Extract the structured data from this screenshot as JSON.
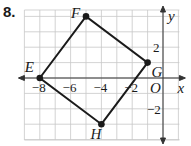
{
  "problem": {
    "number": "8."
  },
  "graph": {
    "x_axis_label": "x",
    "y_axis_label": "y",
    "origin_label": "O",
    "x_ticks": [
      {
        "value": -8,
        "label": "−8"
      },
      {
        "value": -6,
        "label": "−6"
      },
      {
        "value": -4,
        "label": "−4"
      },
      {
        "value": -2,
        "label": "−2"
      }
    ],
    "y_ticks": [
      {
        "value": 2,
        "label": "2"
      },
      {
        "value": -2,
        "label": "−2"
      }
    ],
    "grid": {
      "x_min": -9,
      "x_max": 1,
      "y_min": -4,
      "y_max": 4,
      "step": 1
    },
    "points": [
      {
        "name": "E",
        "x": -8,
        "y": 0
      },
      {
        "name": "F",
        "x": -5,
        "y": 4
      },
      {
        "name": "G",
        "x": -1,
        "y": 1
      },
      {
        "name": "H",
        "x": -4,
        "y": -3
      }
    ],
    "polygon": [
      "E",
      "F",
      "G",
      "H"
    ],
    "colors": {
      "grid": "#c8c8c8",
      "stroke": "#1a1a1a"
    }
  }
}
